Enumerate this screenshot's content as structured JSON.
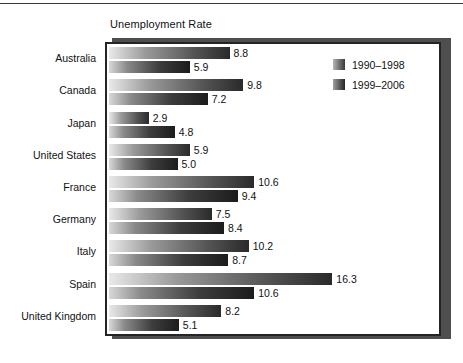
{
  "top_rule": "",
  "chart": {
    "title": "Unemployment Rate"
  },
  "legend": {
    "items": [
      {
        "label": "1990–1998",
        "swatch": "legend-swatch-1990-1998"
      },
      {
        "label": "1999–2006",
        "swatch": "legend-swatch-1999-2006"
      }
    ]
  },
  "chart_data": {
    "type": "bar",
    "orientation": "horizontal",
    "title": "Unemployment Rate",
    "xlabel": "",
    "ylabel": "",
    "grid": false,
    "legend_position": "top-right-inside",
    "xlim": [
      0,
      17.5
    ],
    "categories": [
      "Australia",
      "Canada",
      "Japan",
      "United States",
      "France",
      "Germany",
      "Italy",
      "Spain",
      "United Kingdom"
    ],
    "series": [
      {
        "name": "1990–1998",
        "values": [
          8.8,
          9.8,
          2.9,
          5.9,
          10.6,
          7.5,
          10.2,
          16.3,
          8.2
        ],
        "labels": [
          "8.8",
          "9.8",
          "2.9",
          "5.9",
          "10.6",
          "7.5",
          "10.2",
          "16.3",
          "8.2"
        ]
      },
      {
        "name": "1999–2006",
        "values": [
          5.9,
          7.2,
          4.8,
          5.0,
          9.4,
          8.4,
          8.7,
          10.6,
          5.1
        ],
        "labels": [
          "5.9",
          "7.2",
          "4.8",
          "5.0",
          "9.4",
          "8.4",
          "8.7",
          "10.6",
          "5.1"
        ]
      }
    ]
  },
  "colors": {
    "frame": "#242424",
    "shadow": "#4e4e4e",
    "text": "#111111",
    "background": "#ffffff"
  }
}
